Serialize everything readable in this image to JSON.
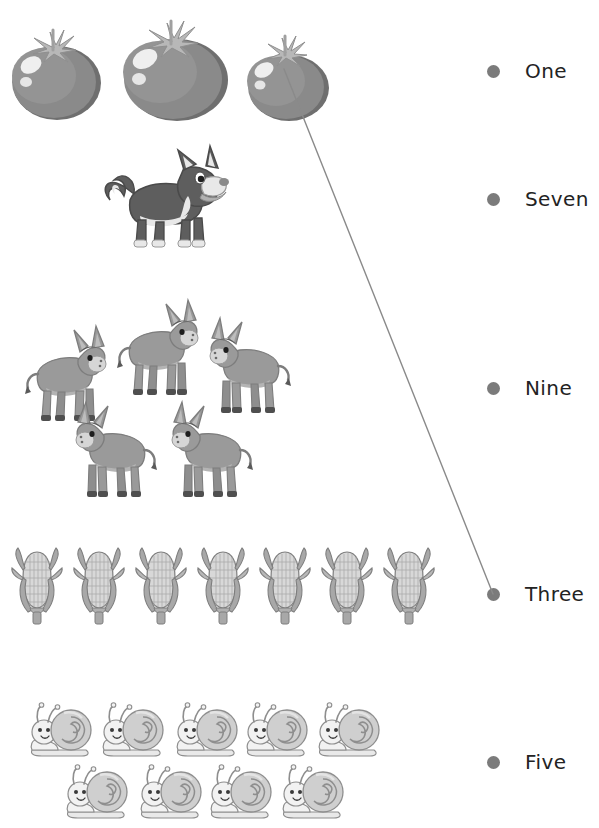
{
  "worksheet": {
    "type": "counting-match",
    "background_color": "#ffffff",
    "palette": {
      "dot": "#7b7b7b",
      "label_text": "#232323",
      "connector_line": "#8a8a8a",
      "tomato_body": "#8a8a8a",
      "tomato_shadow": "#6f6f6f",
      "tomato_highlight": "#efefef",
      "tomato_stem": "#b8b8b8",
      "dog_dark": "#5e5e5e",
      "dog_light": "#e8e8e8",
      "donkey_body": "#9a9a9a",
      "donkey_shade": "#7d7d7d",
      "donkey_hoof": "#4f4f4f",
      "donkey_muzzle": "#d6d6d6",
      "corn_kernel": "#d8d8d8",
      "corn_husk": "#a8a8a8",
      "corn_outline": "#7e7e7e",
      "snail_shell": "#cfcfcf",
      "snail_body": "#f2f2f2",
      "snail_outline": "#8e8e8e"
    },
    "groups": [
      {
        "id": "tomatoes",
        "icon": "tomato-icon",
        "item_name": "tomato",
        "count": 3,
        "count_word": "Three",
        "matched": true
      },
      {
        "id": "dogs",
        "icon": "dog-icon",
        "item_name": "dog",
        "count": 1,
        "count_word": "One",
        "matched": false
      },
      {
        "id": "donkeys",
        "icon": "donkey-icon",
        "item_name": "donkey",
        "count": 5,
        "count_word": "Five",
        "matched": false
      },
      {
        "id": "corn",
        "icon": "corn-icon",
        "item_name": "corn cob",
        "count": 7,
        "count_word": "Seven",
        "matched": false
      },
      {
        "id": "snails",
        "icon": "snail-icon",
        "item_name": "snail",
        "count": 9,
        "count_word": "Nine",
        "matched": false
      }
    ],
    "options": [
      {
        "id": "opt-one",
        "label": "One",
        "dot_name": "option-dot-one",
        "connected": false
      },
      {
        "id": "opt-seven",
        "label": "Seven",
        "dot_name": "option-dot-seven",
        "connected": false
      },
      {
        "id": "opt-nine",
        "label": "Nine",
        "dot_name": "option-dot-nine",
        "connected": false
      },
      {
        "id": "opt-three",
        "label": "Three",
        "dot_name": "option-dot-three",
        "connected": true
      },
      {
        "id": "opt-five",
        "label": "Five",
        "dot_name": "option-dot-five",
        "connected": false
      }
    ],
    "connections": [
      {
        "id": "conn-tomatoes-three",
        "from_group": "tomatoes",
        "to_option": "opt-three",
        "from_x": 284,
        "from_y": 69,
        "to_x": 493,
        "to_y": 594
      }
    ]
  }
}
